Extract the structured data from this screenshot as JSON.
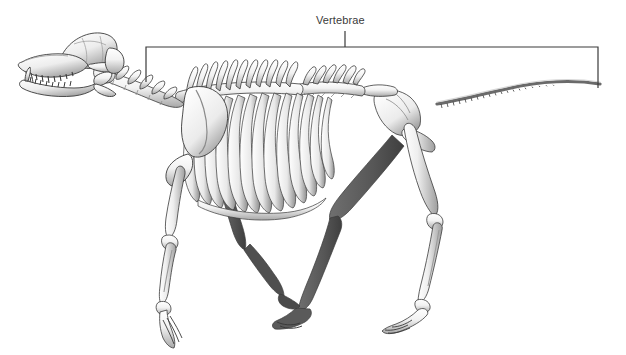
{
  "figure": {
    "background_color": "#ffffff",
    "ink_color": "#3a3a3a",
    "bone_fill": "#f7f7f7",
    "bone_shadow": "#9a9a9a",
    "bone_dark": "#4a4a4a"
  },
  "annotations": [
    {
      "id": "vertebrae",
      "label": "Vertebrae",
      "label_x": 345,
      "label_y": 27,
      "leader_x": 345,
      "leader_y_top": 31,
      "leader_y_bottom": 47,
      "bracket_left_x": 146,
      "bracket_right_x": 598,
      "bracket_top_y": 47,
      "bracket_left_bottom_y": 82,
      "bracket_right_bottom_y": 88,
      "stroke_color": "#3a3a3a",
      "stroke_width": 1.2
    }
  ],
  "skeleton_parts": [
    {
      "name": "skull",
      "label": "Skull"
    },
    {
      "name": "mandible",
      "label": "Mandible"
    },
    {
      "name": "cervical-vertebrae",
      "label": "Cervical vertebrae"
    },
    {
      "name": "thoracic-vertebrae",
      "label": "Thoracic vertebrae"
    },
    {
      "name": "lumbar-vertebrae",
      "label": "Lumbar vertebrae"
    },
    {
      "name": "sacrum",
      "label": "Sacrum"
    },
    {
      "name": "caudal-vertebrae",
      "label": "Caudal vertebrae (tail)"
    },
    {
      "name": "scapula",
      "label": "Scapula"
    },
    {
      "name": "ribcage",
      "label": "Ribcage"
    },
    {
      "name": "sternum",
      "label": "Sternum"
    },
    {
      "name": "humerus",
      "label": "Humerus"
    },
    {
      "name": "radius-ulna",
      "label": "Radius and ulna"
    },
    {
      "name": "forepaw",
      "label": "Forepaw"
    },
    {
      "name": "pelvis",
      "label": "Pelvis"
    },
    {
      "name": "femur",
      "label": "Femur"
    },
    {
      "name": "tibia-fibula",
      "label": "Tibia and fibula"
    },
    {
      "name": "hind-paw",
      "label": "Hind paw"
    }
  ],
  "counts": {
    "ribs_visible": 13,
    "cervical_vertebrae": 7,
    "tail_vertebrae_visible": 20
  }
}
